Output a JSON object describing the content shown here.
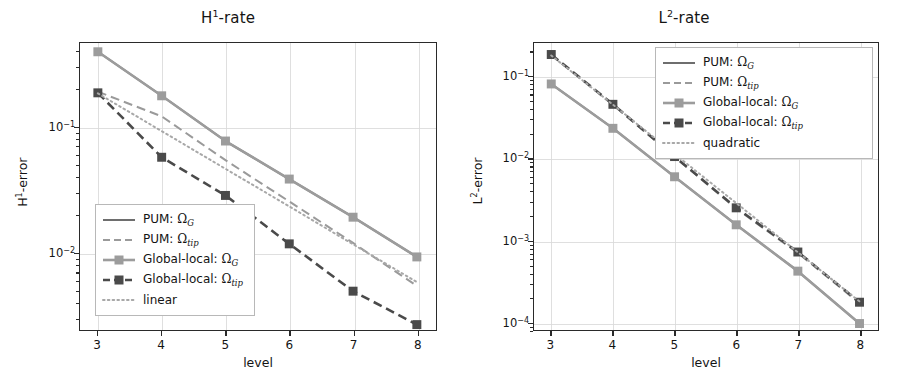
{
  "figure": {
    "background": "#ffffff",
    "panels": [
      "H1-rate",
      "L2-rate"
    ]
  },
  "colors": {
    "pum_g": "#6e6e6e",
    "pum_tip": "#9a9a9a",
    "gl_g": "#9c9c9c",
    "gl_tip": "#4a4a4a",
    "reference": "#a8a8a8",
    "axis": "#2a2a2a",
    "grid": "#d9d9d9",
    "text": "#141414"
  },
  "left": {
    "title_main": "H",
    "title_sup": "1",
    "title_tail": "-rate",
    "title_full": "H¹-rate",
    "xlabel": "level",
    "ylabel_main": "H",
    "ylabel_sup": "1",
    "ylabel_tail": "-error",
    "ylabel_full": "H¹-error",
    "xticks": [
      "3",
      "4",
      "5",
      "6",
      "7",
      "8"
    ],
    "yticks": [
      "10⁻¹",
      "10⁻²"
    ],
    "ytick_exponents": [
      "-1",
      "-2"
    ],
    "legend": [
      {
        "label_prefix": "PUM: ",
        "symbol": "Ω",
        "sub": "G",
        "style": "solid",
        "marker": "none",
        "color": "#6e6e6e",
        "name": "pum-omega-g"
      },
      {
        "label_prefix": "PUM: ",
        "symbol": "Ω",
        "sub": "tip",
        "style": "dashed",
        "marker": "none",
        "color": "#9a9a9a",
        "name": "pum-omega-tip"
      },
      {
        "label_prefix": "Global-local: ",
        "symbol": "Ω",
        "sub": "G",
        "style": "solid",
        "marker": "square",
        "color": "#9c9c9c",
        "name": "global-local-omega-g"
      },
      {
        "label_prefix": "Global-local: ",
        "symbol": "Ω",
        "sub": "tip",
        "style": "dashed",
        "marker": "square",
        "color": "#4a4a4a",
        "name": "global-local-omega-tip"
      },
      {
        "label_prefix": "linear",
        "symbol": "",
        "sub": "",
        "style": "dotted",
        "marker": "none",
        "color": "#a8a8a8",
        "name": "linear-reference"
      }
    ]
  },
  "right": {
    "title_main": "L",
    "title_sup": "2",
    "title_tail": "-rate",
    "title_full": "L²-rate",
    "xlabel": "level",
    "ylabel_main": "L",
    "ylabel_sup": "2",
    "ylabel_tail": "-error",
    "ylabel_full": "L²-error",
    "xticks": [
      "3",
      "4",
      "5",
      "6",
      "7",
      "8"
    ],
    "yticks": [
      "10⁻¹",
      "10⁻²",
      "10⁻³",
      "10⁻⁴"
    ],
    "ytick_exponents": [
      "-1",
      "-2",
      "-3",
      "-4"
    ],
    "legend": [
      {
        "label_prefix": "PUM: ",
        "symbol": "Ω",
        "sub": "G",
        "style": "solid",
        "marker": "none",
        "color": "#6e6e6e",
        "name": "pum-omega-g"
      },
      {
        "label_prefix": "PUM: ",
        "symbol": "Ω",
        "sub": "tip",
        "style": "dashed",
        "marker": "none",
        "color": "#9a9a9a",
        "name": "pum-omega-tip"
      },
      {
        "label_prefix": "Global-local: ",
        "symbol": "Ω",
        "sub": "G",
        "style": "solid",
        "marker": "square",
        "color": "#9c9c9c",
        "name": "global-local-omega-g"
      },
      {
        "label_prefix": "Global-local: ",
        "symbol": "Ω",
        "sub": "tip",
        "style": "dashed",
        "marker": "square",
        "color": "#4a4a4a",
        "name": "global-local-omega-tip"
      },
      {
        "label_prefix": "quadratic",
        "symbol": "",
        "sub": "",
        "style": "dotted",
        "marker": "none",
        "color": "#a8a8a8",
        "name": "quadratic-reference"
      }
    ]
  },
  "chart_data": [
    {
      "type": "line",
      "title": "H¹-rate",
      "xlabel": "level",
      "ylabel": "H¹-error",
      "xscale": "linear",
      "yscale": "log",
      "grid": true,
      "legend_position": "lower-left",
      "x": [
        3,
        4,
        5,
        6,
        7,
        8
      ],
      "xlim": [
        2.72,
        8.3
      ],
      "ylim": [
        0.0024,
        0.47
      ],
      "series": [
        {
          "name": "PUM: Ω_G",
          "values": [
            0.4,
            0.178,
            0.0775,
            0.0385,
            0.0191,
            0.0092
          ],
          "style": "solid",
          "marker": "none",
          "color": "#6e6e6e"
        },
        {
          "name": "PUM: Ω_tip",
          "values": [
            0.192,
            0.122,
            0.0545,
            0.0255,
            0.0119,
            0.0054
          ],
          "style": "dashed",
          "marker": "none",
          "color": "#9a9a9a"
        },
        {
          "name": "Global-local: Ω_G",
          "values": [
            0.4,
            0.178,
            0.0775,
            0.0385,
            0.0191,
            0.0092
          ],
          "style": "solid",
          "marker": "square",
          "color": "#9c9c9c"
        },
        {
          "name": "Global-local: Ω_tip",
          "values": [
            0.188,
            0.0575,
            0.0285,
            0.0117,
            0.0049,
            0.00265
          ],
          "style": "dashed",
          "marker": "square",
          "color": "#4a4a4a"
        },
        {
          "name": "linear",
          "values": [
            0.186,
            0.093,
            0.0465,
            0.0233,
            0.0116,
            0.0058
          ],
          "style": "dotted",
          "marker": "none",
          "color": "#a8a8a8"
        }
      ]
    },
    {
      "type": "line",
      "title": "L²-rate",
      "xlabel": "level",
      "ylabel": "L²-error",
      "xscale": "linear",
      "yscale": "log",
      "grid": true,
      "legend_position": "upper-right",
      "x": [
        3,
        4,
        5,
        6,
        7,
        8
      ],
      "xlim": [
        2.72,
        8.3
      ],
      "ylim": [
        8e-05,
        0.26
      ],
      "series": [
        {
          "name": "PUM: Ω_G",
          "values": [
            0.082,
            0.0235,
            0.006,
            0.00155,
            0.00042,
            9.6e-05
          ],
          "style": "solid",
          "marker": "none",
          "color": "#6e6e6e"
        },
        {
          "name": "PUM: Ω_tip",
          "values": [
            0.185,
            0.0455,
            0.0105,
            0.00245,
            0.0007,
            0.00017
          ],
          "style": "dashed",
          "marker": "none",
          "color": "#9a9a9a"
        },
        {
          "name": "Global-local: Ω_G",
          "values": [
            0.082,
            0.0235,
            0.006,
            0.00155,
            0.00042,
            9.6e-05
          ],
          "style": "solid",
          "marker": "square",
          "color": "#9c9c9c"
        },
        {
          "name": "Global-local: Ω_tip",
          "values": [
            0.188,
            0.0462,
            0.0106,
            0.0025,
            0.00072,
            0.000175
          ],
          "style": "dashed",
          "marker": "square",
          "color": "#4a4a4a"
        },
        {
          "name": "quadratic",
          "values": [
            0.183,
            0.0458,
            0.0114,
            0.00286,
            0.000715,
            0.000179
          ],
          "style": "dotted",
          "marker": "none",
          "color": "#a8a8a8"
        }
      ]
    }
  ]
}
